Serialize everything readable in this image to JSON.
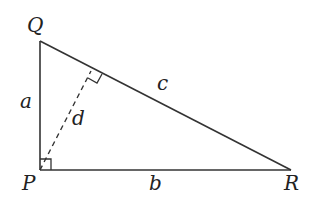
{
  "diagram": {
    "type": "right-triangle",
    "vertices": {
      "P": {
        "label": "P",
        "x": 40,
        "y": 170
      },
      "Q": {
        "label": "Q",
        "x": 40,
        "y": 41
      },
      "R": {
        "label": "R",
        "x": 291,
        "y": 170
      }
    },
    "sides": {
      "a": {
        "label": "a",
        "from": "P",
        "to": "Q"
      },
      "b": {
        "label": "b",
        "from": "P",
        "to": "R"
      },
      "c": {
        "label": "c",
        "from": "Q",
        "to": "R"
      }
    },
    "altitude": {
      "label": "d",
      "from": "P",
      "to_side": "c",
      "style": "dashed"
    },
    "right_angles": [
      "P",
      "foot of d on c"
    ],
    "colors": {
      "stroke": "#333333",
      "text": "#222222",
      "background": "#ffffff"
    }
  }
}
